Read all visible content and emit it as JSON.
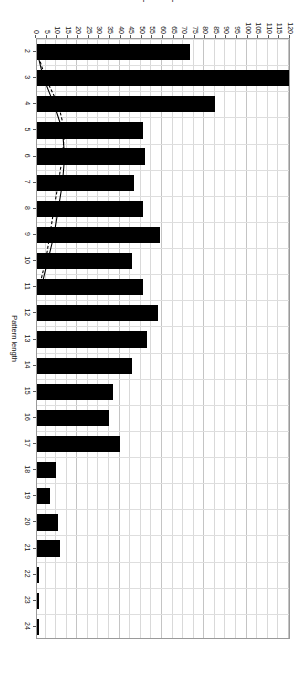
{
  "chart_data": {
    "type": "bar",
    "title": "",
    "subtitle": "",
    "xlabel": "Pattern length",
    "ylabel": "Independent patterns",
    "orientation": "vertical-bars-rendered-rotated-90",
    "grid": true,
    "legend_position": "none",
    "xlim": [
      2,
      24
    ],
    "ylim": [
      0,
      120
    ],
    "y_tick_step": 5,
    "y_ticks": [
      120,
      115,
      110,
      105,
      100,
      95,
      90,
      85,
      80,
      75,
      70,
      65,
      60,
      55,
      50,
      45,
      40,
      35,
      30,
      25,
      20,
      15,
      10,
      5,
      0
    ],
    "x_ticks": [
      2,
      3,
      4,
      5,
      6,
      7,
      8,
      9,
      10,
      11,
      12,
      13,
      14,
      15,
      16,
      17,
      18,
      19,
      20,
      21,
      22,
      23,
      24
    ],
    "categories": [
      2,
      3,
      4,
      5,
      6,
      7,
      8,
      9,
      10,
      11,
      12,
      13,
      14,
      15,
      16,
      17,
      18,
      19,
      20,
      21,
      22,
      23,
      24
    ],
    "values": [
      73,
      120,
      85,
      51,
      52,
      47,
      51,
      59,
      46,
      51,
      58,
      53,
      46,
      37,
      35,
      40,
      10,
      7,
      11,
      12,
      2,
      2,
      2
    ],
    "series": [
      {
        "name": "Independent patterns",
        "type": "bar",
        "color": "#000000",
        "values": [
          73,
          120,
          85,
          51,
          52,
          47,
          51,
          59,
          46,
          51,
          58,
          53,
          46,
          37,
          35,
          40,
          10,
          7,
          11,
          12,
          2,
          2,
          2
        ]
      },
      {
        "name": "cumulative-curve-solid",
        "type": "line",
        "style": "solid",
        "color": "#000000",
        "x": [
          2,
          3,
          4,
          5,
          6,
          7,
          8,
          9,
          10,
          11
        ],
        "values": [
          1,
          4,
          9,
          13,
          14,
          13,
          11,
          9,
          6,
          3
        ]
      },
      {
        "name": "cumulative-curve-dashed",
        "type": "line",
        "style": "dashed",
        "color": "#000000",
        "x": [
          2,
          3,
          4,
          5,
          6,
          7,
          8,
          9,
          10,
          11
        ],
        "values": [
          1,
          5,
          11,
          14,
          13,
          11,
          9,
          7,
          5,
          2
        ]
      }
    ],
    "bar_labels": {
      "2": "73",
      "3": "120",
      "4": "85",
      "5": "51",
      "6": "52",
      "7": "47",
      "8": "51",
      "9": "59",
      "10": "46",
      "11": "51",
      "12": "58",
      "13": "53",
      "14": "46",
      "15": "37",
      "16": "35",
      "17": "40",
      "18": "10",
      "19": "7",
      "20": "11",
      "21": "12",
      "22": "2",
      "23": "2",
      "24": "2"
    }
  },
  "colors": {
    "bar": "#000000",
    "grid_minor": "#dedede",
    "grid_major": "#c4c4c4",
    "frame": "#9a9a9a",
    "text": "#111111",
    "background": "#ffffff"
  }
}
